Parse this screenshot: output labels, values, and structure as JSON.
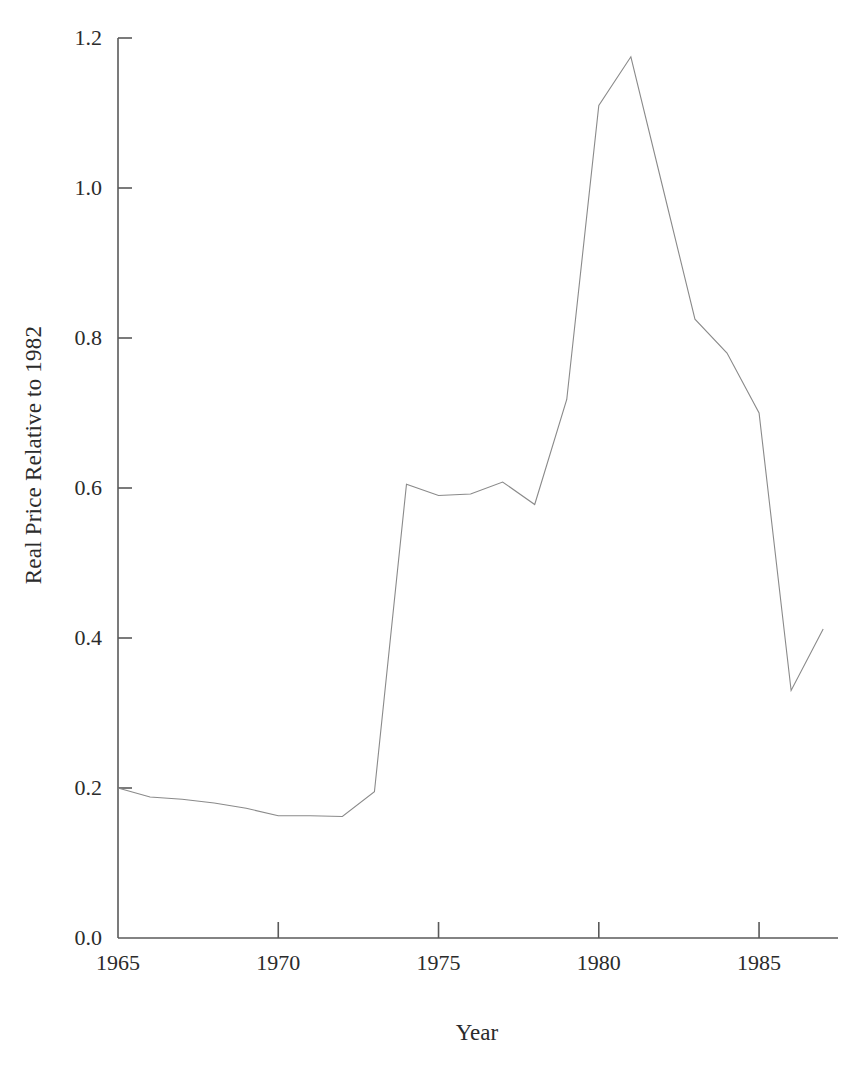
{
  "figure": {
    "background_color": "#ffffff",
    "line_color": "#8a8a8a",
    "axis_color": "#5a5a5a",
    "text_color": "#2b2b2b",
    "caption": ""
  },
  "chart_data": {
    "type": "line",
    "title": "",
    "xlabel": "Year",
    "ylabel": "Real Price Relative to 1982",
    "xlim": [
      1965,
      1987.4
    ],
    "ylim": [
      0.0,
      1.2
    ],
    "grid": false,
    "legend": null,
    "xticks": [
      1965,
      1970,
      1975,
      1980,
      1985
    ],
    "xticklabels": [
      "1965",
      "1970",
      "1975",
      "1980",
      "1985"
    ],
    "yticks": [
      0.0,
      0.2,
      0.4,
      0.6,
      0.8,
      1.0,
      1.2
    ],
    "yticklabels": [
      "0.0",
      "0.2",
      "0.4",
      "0.6",
      "0.8",
      "1.0",
      "1.2"
    ],
    "series": [
      {
        "name": "Real Price Relative to 1982",
        "x": [
          1965,
          1966,
          1967,
          1968,
          1969,
          1970,
          1971,
          1972,
          1973,
          1974,
          1975,
          1976,
          1977,
          1978,
          1979,
          1980,
          1981,
          1982,
          1983,
          1984,
          1985,
          1986,
          1987
        ],
        "values": [
          0.2,
          0.188,
          0.185,
          0.18,
          0.173,
          0.163,
          0.163,
          0.162,
          0.195,
          0.605,
          0.59,
          0.592,
          0.608,
          0.578,
          0.718,
          1.11,
          1.175,
          1.0,
          0.825,
          0.78,
          0.7,
          0.33,
          0.412
        ]
      }
    ]
  }
}
